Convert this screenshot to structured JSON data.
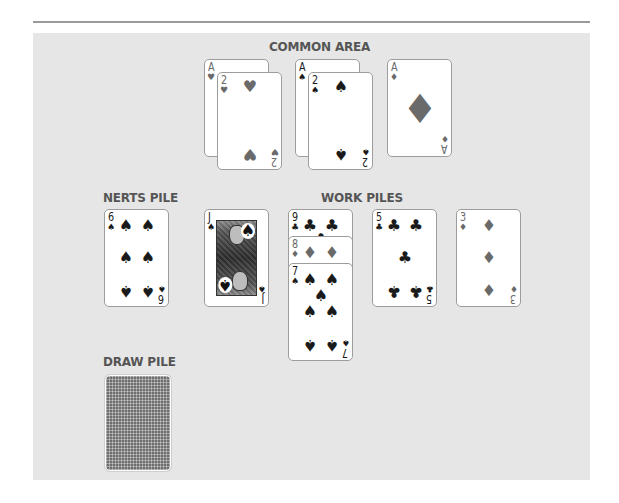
{
  "game": "Nerts",
  "labels": {
    "common_area": "COMMON AREA",
    "nerts_pile": "NERTS PILE",
    "work_piles": "WORK PILES",
    "draw_pile": "DRAW PILE"
  },
  "colors": {
    "table": "#e6e6e6",
    "label_text": "#555555",
    "card_face": "#ffffff",
    "card_border": "#9d9d9d",
    "black_suit": "#1a1a1a",
    "red_suit": "#6a6a6a",
    "card_back": "#6e6e6e"
  },
  "common_area": {
    "piles": [
      {
        "cards": [
          {
            "rank": "A",
            "suit": "♥",
            "color": "red"
          },
          {
            "rank": "2",
            "suit": "♥",
            "color": "red"
          }
        ]
      },
      {
        "cards": [
          {
            "rank": "A",
            "suit": "♠",
            "color": "black"
          },
          {
            "rank": "2",
            "suit": "♠",
            "color": "black"
          }
        ]
      },
      {
        "cards": [
          {
            "rank": "A",
            "suit": "♦",
            "color": "red"
          }
        ]
      }
    ]
  },
  "nerts_pile": {
    "top_card": {
      "rank": "6",
      "suit": "♠",
      "color": "black"
    }
  },
  "work_piles": [
    {
      "cards": [
        {
          "rank": "J",
          "suit": "♠",
          "color": "black"
        }
      ]
    },
    {
      "cards": [
        {
          "rank": "9",
          "suit": "♣",
          "color": "black"
        },
        {
          "rank": "8",
          "suit": "♦",
          "color": "red"
        },
        {
          "rank": "7",
          "suit": "♠",
          "color": "black"
        }
      ]
    },
    {
      "cards": [
        {
          "rank": "5",
          "suit": "♣",
          "color": "black"
        }
      ]
    },
    {
      "cards": [
        {
          "rank": "3",
          "suit": "♦",
          "color": "red"
        }
      ]
    }
  ],
  "draw_pile": {
    "face_down": true
  }
}
